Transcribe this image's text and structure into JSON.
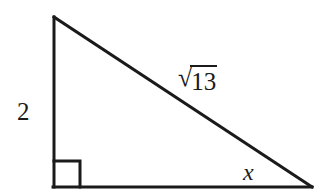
{
  "figure": {
    "type": "right-triangle-diagram",
    "background_color": "#ffffff",
    "stroke_color": "#1a1a1a",
    "stroke_width": 3,
    "width": 321,
    "height": 196,
    "vertices": {
      "apex": [
        54,
        17
      ],
      "right_angle": [
        54,
        187
      ],
      "base_right": [
        312,
        187
      ]
    },
    "right_angle_marker": {
      "size": 26,
      "origin": [
        54,
        187
      ]
    }
  },
  "labels": {
    "vertical_leg": "2",
    "hypotenuse_radical_symbol": "√",
    "hypotenuse_radicand": "13",
    "hypotenuse_full": "√13",
    "angle": "x"
  }
}
